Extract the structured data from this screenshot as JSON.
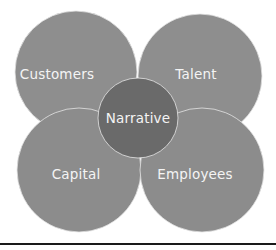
{
  "diagram": {
    "type": "overlapping-circles",
    "center": {
      "label": "Narrative",
      "color": "#6b6b6b"
    },
    "petals": [
      {
        "label": "Customers",
        "position": "top-left",
        "color": "#8f8f8f"
      },
      {
        "label": "Talent",
        "position": "top-right",
        "color": "#8f8f8f"
      },
      {
        "label": "Capital",
        "position": "bottom-left",
        "color": "#8f8f8f"
      },
      {
        "label": "Employees",
        "position": "bottom-right",
        "color": "#8f8f8f"
      }
    ],
    "stroke_color": "#e6e6e6"
  }
}
